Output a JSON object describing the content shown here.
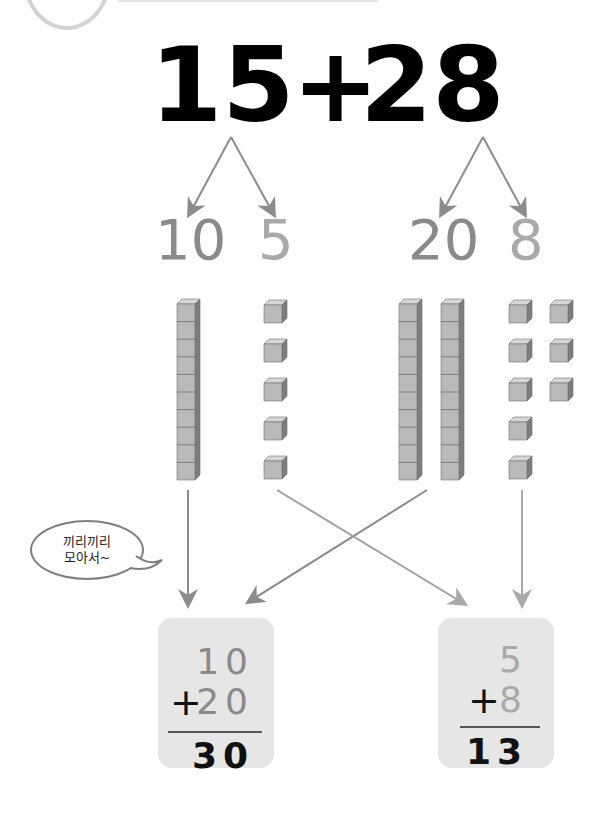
{
  "header": {
    "decoration": "circle-tab"
  },
  "problem": {
    "addend1": "15",
    "operator": "+",
    "addend2": "28"
  },
  "decomposition": {
    "addend1_tens": "10",
    "addend1_ones": "5",
    "addend2_tens": "20",
    "addend2_ones": "8"
  },
  "blocks": {
    "addend1_rods": 1,
    "addend1_units": 5,
    "addend2_rods": 2,
    "addend2_units": 8
  },
  "speech_bubble": {
    "line1": "끼리끼리",
    "line2": "모아서~"
  },
  "tens_card": {
    "top": "10",
    "operator": "+",
    "second": "20",
    "result": "30"
  },
  "ones_card": {
    "top": "5",
    "operator": "+",
    "second": "8",
    "result": "13"
  },
  "colors": {
    "tens_text": "#8a8a8a",
    "ones_text": "#a9a9a9",
    "arrow": "#8c8c8c",
    "card_bg": "#e6e6e6",
    "block_face": "#b9b9b9",
    "block_side": "#7d7d7d",
    "block_top": "#d6d6d6"
  }
}
